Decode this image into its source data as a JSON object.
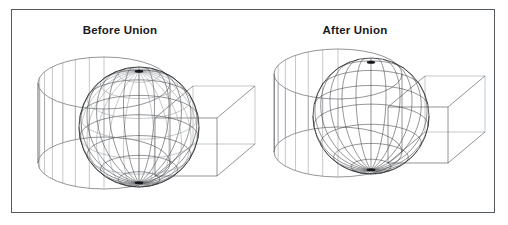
{
  "figure": {
    "width": 508,
    "height": 225,
    "background_color": "#ffffff",
    "border_color": "#555a5e",
    "line_color": "#3a3d41",
    "line_color_light": "#8a8e92",
    "line_color_dark": "#1d2022"
  },
  "panels": [
    {
      "id": "before",
      "title": "Before Union",
      "description": "Wireframe sphere, cylinder and box shown as separate overlapping solids with all edges visible",
      "solids": [
        "sphere",
        "cylinder",
        "box"
      ]
    },
    {
      "id": "after",
      "title": "After Union",
      "description": "Same three solids merged into a single union solid with interior edges removed",
      "solids": [
        "sphere",
        "cylinder",
        "box"
      ]
    }
  ],
  "geometry": {
    "before": {
      "sphere": {
        "cx": 139,
        "cy": 127,
        "r": 60,
        "meridians": 12,
        "parallels": 9
      },
      "cylinder": {
        "cx": 104,
        "cy": 123,
        "rx": 66,
        "ry": 26,
        "half_height": 40,
        "rulings": 14
      },
      "box": {
        "ox": 155,
        "oy": 118,
        "w": 62,
        "h": 58,
        "dx": 38,
        "dy": -32
      }
    },
    "after": {
      "sphere": {
        "cx": 371,
        "cy": 116,
        "r": 58,
        "meridians": 12,
        "parallels": 9
      },
      "cylinder": {
        "cx": 338,
        "cy": 113,
        "rx": 64,
        "ry": 25,
        "half_height": 39,
        "rulings": 13
      },
      "box": {
        "ox": 388,
        "oy": 107,
        "w": 60,
        "h": 56,
        "dx": 37,
        "dy": -31
      }
    }
  }
}
